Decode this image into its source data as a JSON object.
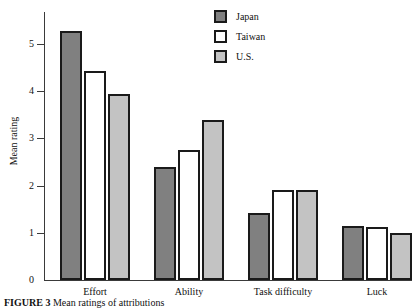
{
  "figure": {
    "caption_label": "FIGURE 3",
    "caption_text": "Mean ratings of attributions"
  },
  "legend": {
    "position": "top-right",
    "items": [
      {
        "label": "Japan",
        "color": "#808080"
      },
      {
        "label": "Taiwan",
        "color": "#ffffff"
      },
      {
        "label": "U.S.",
        "color": "#c3c3c3"
      }
    ]
  },
  "axes": {
    "y_title": "Mean rating",
    "y_ticks": [
      "0",
      "1",
      "2",
      "3",
      "4",
      "5"
    ]
  },
  "chart_data": {
    "type": "bar",
    "title": "",
    "xlabel": "",
    "ylabel": "Mean rating",
    "ylim": [
      0,
      5.55
    ],
    "grid": false,
    "legend_position": "top-right",
    "categories": [
      "Effort",
      "Ability",
      "Task difficulty",
      "Luck"
    ],
    "series": [
      {
        "name": "Japan",
        "color": "#808080",
        "values": [
          5.27,
          2.4,
          1.42,
          1.15
        ]
      },
      {
        "name": "Taiwan",
        "color": "#ffffff",
        "values": [
          4.43,
          2.75,
          1.9,
          1.13
        ]
      },
      {
        "name": "U.S.",
        "color": "#c3c3c3",
        "values": [
          3.94,
          3.4,
          1.9,
          1.0
        ]
      }
    ]
  }
}
